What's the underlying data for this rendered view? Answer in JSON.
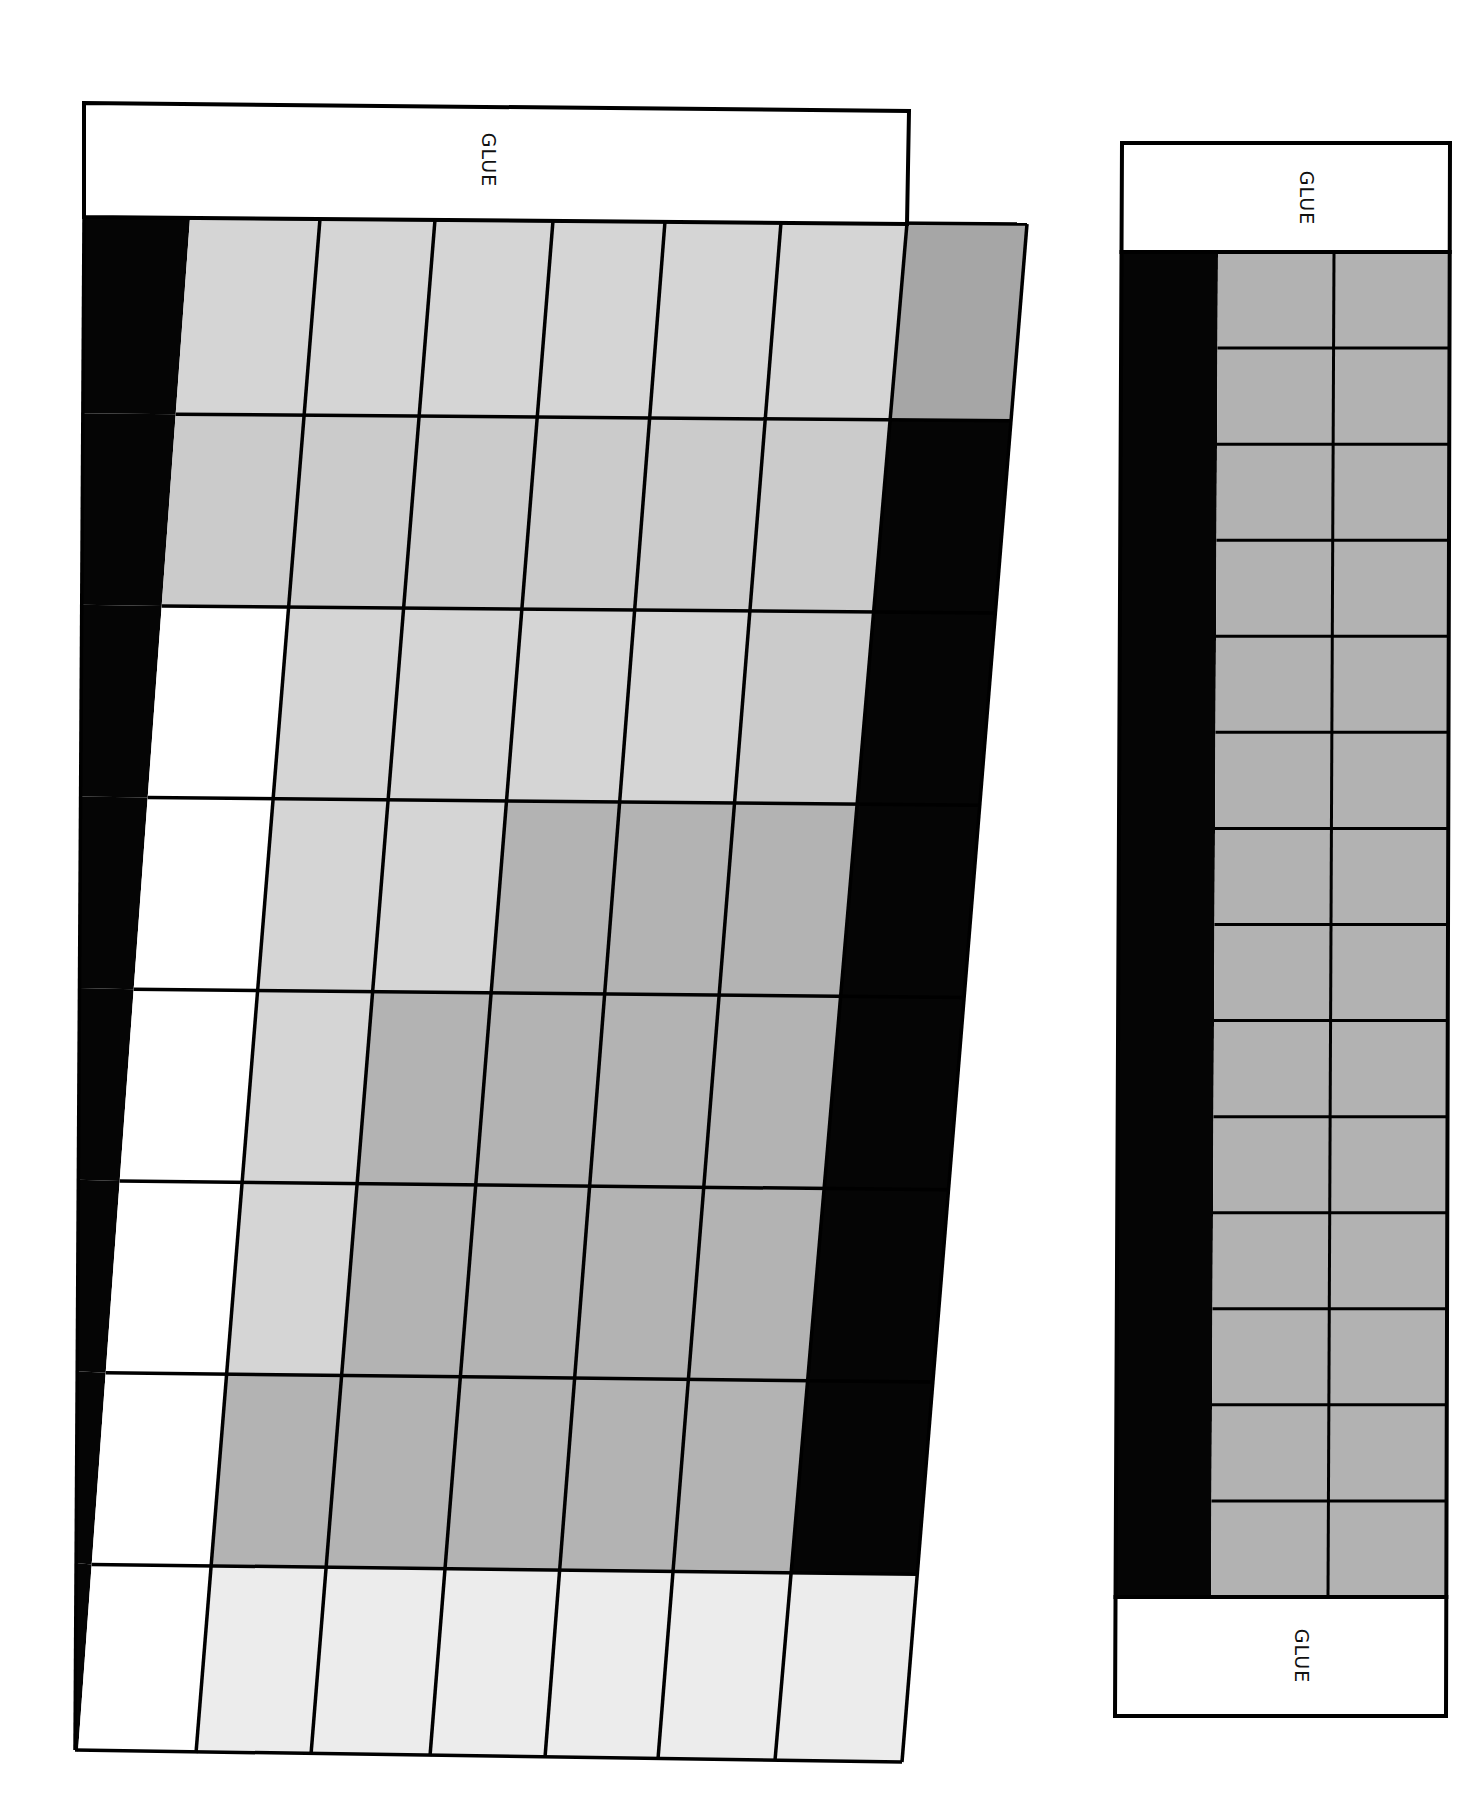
{
  "page": {
    "background": "#ffffff",
    "line_color": "#000000"
  },
  "colors": {
    "black": "#050505",
    "white": "#ffffff",
    "light": "#d5d5d5",
    "light2": "#cbcbcb",
    "medium": "#b3b3b3",
    "medium_dark": "#a6a6a6",
    "very_light": "#ececec",
    "strip_gray": "#b2b2b2"
  },
  "main_piece": {
    "glue_tab": {
      "label": "GLUE",
      "corners": [
        [
          84,
          103
        ],
        [
          909,
          111
        ],
        [
          907,
          224
        ],
        [
          84,
          217
        ]
      ]
    },
    "grid": {
      "top_edge_x": [
        84,
        190,
        320,
        435,
        553,
        665,
        781,
        907,
        1027
      ],
      "top_y_left": 217,
      "top_y_right": 224,
      "bottom_edge_x": [
        75,
        78,
        196,
        311,
        430,
        545,
        658,
        775,
        902
      ],
      "bottom_y_left": 1750,
      "bottom_y_right": 1762,
      "row_fractions": [
        0,
        0.128,
        0.253,
        0.378,
        0.503,
        0.628,
        0.753,
        0.878,
        1.0
      ],
      "rows": [
        [
          "black",
          "light",
          "light",
          "light",
          "light",
          "light",
          "light",
          "medium_dark"
        ],
        [
          "black",
          "light2",
          "light2",
          "light2",
          "light2",
          "light2",
          "light2",
          "black"
        ],
        [
          "black",
          "white",
          "light",
          "light",
          "light",
          "light",
          "light2",
          "black"
        ],
        [
          "black",
          "white",
          "light",
          "light",
          "medium",
          "medium",
          "medium",
          "black"
        ],
        [
          "black",
          "white",
          "light",
          "medium",
          "medium",
          "medium",
          "medium",
          "black"
        ],
        [
          "black",
          "white",
          "light",
          "medium",
          "medium",
          "medium",
          "medium",
          "black"
        ],
        [
          "black",
          "white",
          "medium",
          "medium",
          "medium",
          "medium",
          "medium",
          "black"
        ],
        [
          "black",
          "white",
          "very_light",
          "very_light",
          "very_light",
          "very_light",
          "very_light",
          "very_light"
        ]
      ]
    }
  },
  "side_strip": {
    "top_glue": {
      "label": "GLUE",
      "y_top": 143,
      "y_bottom": 252
    },
    "bottom_glue": {
      "label": "GLUE",
      "y_top": 1597,
      "y_bottom": 1716
    },
    "x_left_top": 1122,
    "x_left_bottom": 1115,
    "x_right_top": 1450,
    "x_right_bottom": 1446,
    "black_col_right_top": 1218,
    "black_col_right_bottom": 1211,
    "divider_top": 1334,
    "divider_bottom": 1328,
    "row_count": 14
  }
}
